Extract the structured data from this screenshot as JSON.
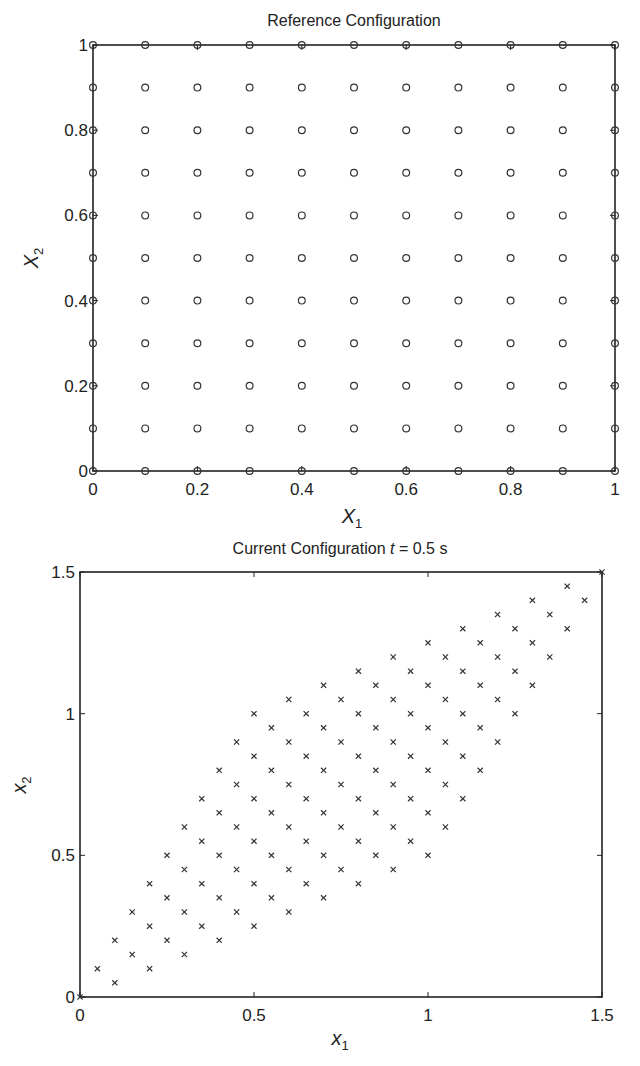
{
  "chart_data": [
    {
      "id": "reference",
      "type": "scatter",
      "title": "Reference Configuration",
      "xlabel": "X",
      "xlabel_sub": "1",
      "ylabel": "X",
      "ylabel_sub": "2",
      "marker": "circle",
      "xlim": [
        0,
        1
      ],
      "ylim": [
        0,
        1
      ],
      "xticks": [
        "0",
        "0.2",
        "0.4",
        "0.6",
        "0.8",
        "1"
      ],
      "xtick_values": [
        0,
        0.2,
        0.4,
        0.6,
        0.8,
        1
      ],
      "yticks": [
        "0",
        "0.2",
        "0.4",
        "0.6",
        "0.8",
        "1"
      ],
      "ytick_values": [
        0,
        0.2,
        0.4,
        0.6,
        0.8,
        1
      ],
      "grid": false,
      "points_description": "11 x 11 uniform grid, X1 and X2 from 0 to 1 in steps of 0.1",
      "grid_spec": {
        "start": 0,
        "stop": 1,
        "step": 0.1,
        "count": 11
      },
      "boundary_lines": "square outline from (0,0) to (1,1)"
    },
    {
      "id": "current",
      "type": "scatter",
      "title": "Current Configuration ",
      "title_italic": "t",
      "title_suffix": " = 0.5 s",
      "xlabel": "x",
      "xlabel_sub": "1",
      "ylabel": "x",
      "ylabel_sub": "2",
      "marker": "x",
      "xlim": [
        0,
        1.5
      ],
      "ylim": [
        0,
        1.5
      ],
      "xticks": [
        "0",
        "0.5",
        "1",
        "1.5"
      ],
      "xtick_values": [
        0,
        0.5,
        1,
        1.5
      ],
      "yticks": [
        "0",
        "0.5",
        "1",
        "1.5"
      ],
      "ytick_values": [
        0,
        0.5,
        1,
        1.5
      ],
      "grid": false,
      "mapping": {
        "x1": "X1 + 0.5*X2",
        "x2": "0.5*X1 + X2"
      },
      "mapping_coeffs": {
        "a11": 1,
        "a12": 0.5,
        "a21": 0.5,
        "a22": 1
      },
      "points_description": "Reference 11x11 grid sheared: x1 = X1 + 0.5 X2, x2 = 0.5 X1 + X2; corners at (0,0), (1,0.5), (0.5,1), (1.5,1.5)"
    }
  ]
}
